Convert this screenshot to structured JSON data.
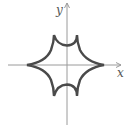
{
  "figure": {
    "x_axis_label": "x",
    "y_axis_label": "y",
    "colors": {
      "axis": "#9a9a9a",
      "curve": "#4a4a4a",
      "label": "#555555",
      "background": "#ffffff"
    },
    "curve": {
      "description": "closed curve with six cusps: two on the x-axis and two above and below the origin",
      "cusps": [
        {
          "position": "left",
          "on_axis": "x"
        },
        {
          "position": "right",
          "on_axis": "x"
        },
        {
          "position": "upper-left"
        },
        {
          "position": "upper-right"
        },
        {
          "position": "lower-left"
        },
        {
          "position": "lower-right"
        }
      ]
    }
  }
}
